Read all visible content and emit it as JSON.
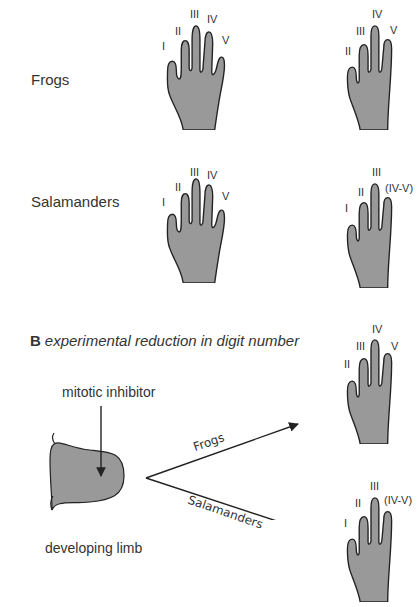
{
  "section_a": {
    "rows": [
      {
        "label": "Frogs",
        "normal_hand": {
          "digits": [
            "I",
            "II",
            "III",
            "IV",
            "V"
          ]
        },
        "reduced_hand": {
          "digits": [
            "II",
            "III",
            "IV",
            "V"
          ]
        }
      },
      {
        "label": "Salamanders",
        "normal_hand": {
          "digits": [
            "I",
            "II",
            "III",
            "IV",
            "V"
          ]
        },
        "reduced_hand": {
          "digits": [
            "I",
            "II",
            "III",
            "(IV-V)"
          ]
        }
      }
    ]
  },
  "section_b": {
    "letter": "B",
    "title": "experimental reduction in digit number",
    "treatment_label": "mitotic inhibitor",
    "limb_label": "developing limb",
    "branches": [
      {
        "label": "Frogs",
        "digits": [
          "II",
          "III",
          "IV",
          "V"
        ]
      },
      {
        "label": "Salamanders",
        "digits": [
          "I",
          "II",
          "III",
          "(IV-V)"
        ]
      }
    ]
  },
  "colors": {
    "hand_fill": "#999999",
    "outline": "#222222"
  }
}
